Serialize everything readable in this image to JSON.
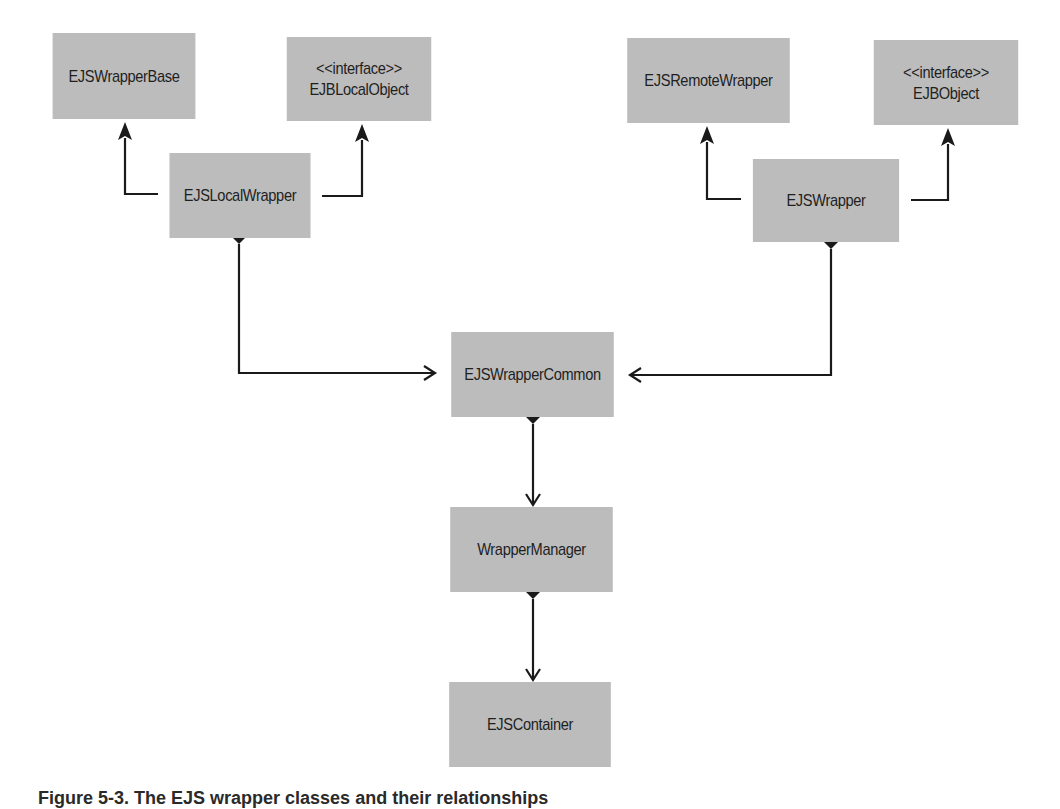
{
  "diagram": {
    "type": "UML class diagram",
    "classes": {
      "ejs_wrapper_base": {
        "name": "EJSWrapperBase",
        "stereotype": ""
      },
      "ejb_local_object": {
        "name": "EJBLocalObject",
        "stereotype": "<<interface>>"
      },
      "ejs_local_wrapper": {
        "name": "EJSLocalWrapper",
        "stereotype": ""
      },
      "ejs_remote_wrapper": {
        "name": "EJSRemoteWrapper",
        "stereotype": ""
      },
      "ejb_object": {
        "name": "EJBObject",
        "stereotype": "<<interface>>"
      },
      "ejs_wrapper": {
        "name": "EJSWrapper",
        "stereotype": ""
      },
      "ejs_wrapper_common": {
        "name": "EJSWrapperCommon",
        "stereotype": ""
      },
      "wrapper_manager": {
        "name": "WrapperManager",
        "stereotype": ""
      },
      "ejs_container": {
        "name": "EJSContainer",
        "stereotype": ""
      }
    },
    "relationships": [
      {
        "from": "EJSLocalWrapper",
        "to": "EJSWrapperBase",
        "kind": "generalization"
      },
      {
        "from": "EJSLocalWrapper",
        "to": "EJBLocalObject",
        "kind": "realization"
      },
      {
        "from": "EJSWrapper",
        "to": "EJSRemoteWrapper",
        "kind": "generalization"
      },
      {
        "from": "EJSWrapper",
        "to": "EJBObject",
        "kind": "realization"
      },
      {
        "from": "EJSLocalWrapper",
        "to": "EJSWrapperCommon",
        "kind": "composition"
      },
      {
        "from": "EJSWrapper",
        "to": "EJSWrapperCommon",
        "kind": "composition"
      },
      {
        "from": "EJSWrapperCommon",
        "to": "WrapperManager",
        "kind": "composition"
      },
      {
        "from": "WrapperManager",
        "to": "EJSContainer",
        "kind": "composition"
      }
    ],
    "colors": {
      "box_fill": "#bcbcbc",
      "line": "#1a1a1a",
      "text": "#1f1f1f"
    }
  },
  "caption": {
    "text": "Figure 5-3. The EJS wrapper classes and their relationships"
  }
}
